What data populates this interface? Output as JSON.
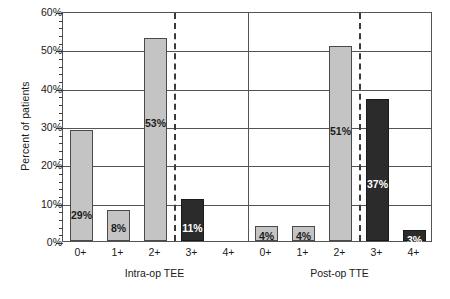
{
  "chart_data": {
    "type": "bar",
    "title": "",
    "xlabel": "",
    "ylabel": "Percent of patients",
    "ylim": [
      0,
      60
    ],
    "ytick_labels": [
      "0%",
      "10%",
      "20%",
      "30%",
      "40%",
      "50%",
      "60%"
    ],
    "ytick_values": [
      0,
      10,
      20,
      30,
      40,
      50,
      60
    ],
    "minor_tick_step": 2,
    "grid": "horizontal-major",
    "legend": "none",
    "categories": [
      "0+",
      "1+",
      "2+",
      "3+",
      "4+"
    ],
    "groups": [
      {
        "name": "Intra-op TEE",
        "values": [
          29,
          8,
          53,
          11,
          0
        ],
        "labels": [
          "29%",
          "8%",
          "53%",
          "11%",
          ""
        ],
        "shades": [
          "light",
          "light",
          "light",
          "dark",
          "none"
        ],
        "dashed_divider_after": "2+"
      },
      {
        "name": "Post-op TTE",
        "values": [
          4,
          4,
          51,
          37,
          3
        ],
        "labels": [
          "4%",
          "4%",
          "51%",
          "37%",
          "3%"
        ],
        "shades": [
          "light",
          "light",
          "light",
          "dark",
          "dark"
        ],
        "dashed_divider_after": "2+"
      }
    ],
    "colors": {
      "light_bar": "#c4c4c4",
      "dark_bar": "#2b2b2b",
      "axis": "#545454",
      "background": "#ffffff"
    }
  }
}
